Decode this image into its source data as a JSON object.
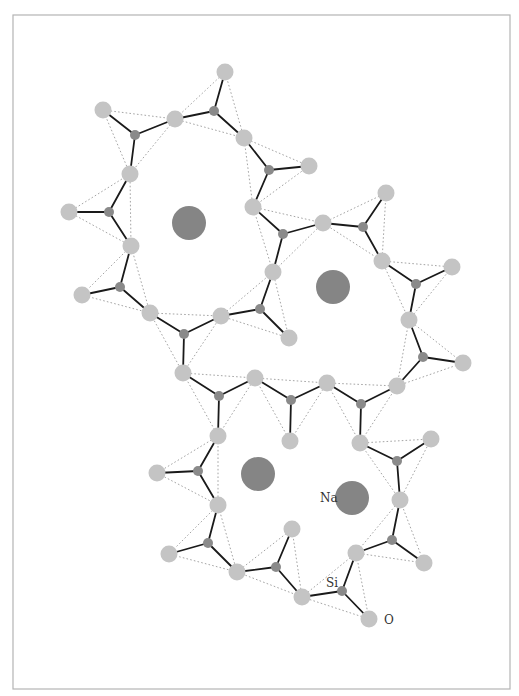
{
  "diagram": {
    "title": "",
    "frame": {
      "x": 13,
      "y": 15,
      "width": 497,
      "height": 674
    },
    "colors": {
      "oxygen": "#c4c4c4",
      "silicon": "#8a8a8a",
      "sodium": "#858585",
      "bond": "#1a1a1a",
      "tetrahedron_edge": "#9a9a9a",
      "frame": "#b4b4b4"
    },
    "labels": [
      {
        "id": "label-na",
        "text": "Na",
        "x": 320,
        "y": 502
      },
      {
        "id": "label-si",
        "text": "Si",
        "x": 326,
        "y": 587
      },
      {
        "id": "label-o",
        "text": "O",
        "x": 384,
        "y": 624
      }
    ],
    "sodium": [
      {
        "x": 189,
        "y": 223,
        "r": 17
      },
      {
        "x": 333,
        "y": 287,
        "r": 17
      },
      {
        "x": 258,
        "y": 474,
        "r": 17
      },
      {
        "x": 352,
        "y": 498,
        "r": 17
      }
    ],
    "oxygen": [
      [
        225,
        72
      ],
      [
        103,
        110
      ],
      [
        175,
        119
      ],
      [
        244,
        138
      ],
      [
        309,
        166
      ],
      [
        130,
        174
      ],
      [
        253,
        207
      ],
      [
        386,
        193
      ],
      [
        69,
        212
      ],
      [
        323,
        223
      ],
      [
        131,
        246
      ],
      [
        382,
        261
      ],
      [
        452,
        267
      ],
      [
        273,
        272
      ],
      [
        82,
        295
      ],
      [
        150,
        313
      ],
      [
        221,
        316
      ],
      [
        289,
        338
      ],
      [
        409,
        320
      ],
      [
        463,
        363
      ],
      [
        183,
        373
      ],
      [
        255,
        378
      ],
      [
        327,
        383
      ],
      [
        397,
        386
      ],
      [
        218,
        436
      ],
      [
        290,
        441
      ],
      [
        360,
        443
      ],
      [
        431,
        439
      ],
      [
        157,
        473
      ],
      [
        400,
        500
      ],
      [
        218,
        505
      ],
      [
        292,
        529
      ],
      [
        356,
        553
      ],
      [
        169,
        554
      ],
      [
        424,
        563
      ],
      [
        237,
        572
      ],
      [
        302,
        597
      ],
      [
        369,
        619
      ]
    ],
    "oxygen_radius": 8.5,
    "silicon_radius": 5,
    "tetrahedra": [
      {
        "si": [
          135,
          135
        ],
        "o": [
          1,
          2,
          5
        ]
      },
      {
        "si": [
          214,
          111
        ],
        "o": [
          0,
          2,
          3
        ]
      },
      {
        "si": [
          269,
          170
        ],
        "o": [
          3,
          4,
          6
        ]
      },
      {
        "si": [
          109,
          212
        ],
        "o": [
          8,
          5,
          10
        ]
      },
      {
        "si": [
          120,
          287
        ],
        "o": [
          10,
          14,
          15
        ]
      },
      {
        "si": [
          184,
          334
        ],
        "o": [
          15,
          16,
          20
        ]
      },
      {
        "si": [
          260,
          309
        ],
        "o": [
          16,
          13,
          17
        ]
      },
      {
        "si": [
          283,
          234
        ],
        "o": [
          6,
          9,
          13
        ]
      },
      {
        "si": [
          363,
          227
        ],
        "o": [
          9,
          7,
          11
        ]
      },
      {
        "si": [
          416,
          284
        ],
        "o": [
          11,
          12,
          18
        ]
      },
      {
        "si": [
          423,
          357
        ],
        "o": [
          18,
          19,
          23
        ]
      },
      {
        "si": [
          219,
          396
        ],
        "o": [
          20,
          21,
          24
        ]
      },
      {
        "si": [
          291,
          400
        ],
        "o": [
          21,
          22,
          25
        ]
      },
      {
        "si": [
          361,
          404
        ],
        "o": [
          22,
          23,
          26
        ]
      },
      {
        "si": [
          397,
          461
        ],
        "o": [
          26,
          27,
          29
        ]
      },
      {
        "si": [
          198,
          471
        ],
        "o": [
          24,
          28,
          30
        ]
      },
      {
        "si": [
          208,
          543
        ],
        "o": [
          30,
          33,
          35
        ]
      },
      {
        "si": [
          276,
          567
        ],
        "o": [
          35,
          31,
          36
        ]
      },
      {
        "si": [
          342,
          591
        ],
        "o": [
          36,
          32,
          37
        ]
      },
      {
        "si": [
          392,
          540
        ],
        "o": [
          29,
          32,
          34
        ]
      }
    ]
  }
}
